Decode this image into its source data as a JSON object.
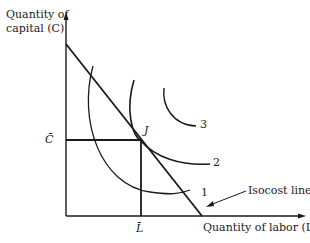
{
  "diagram": {
    "y_axis_label_line1": "Quantity of",
    "y_axis_label_line2": "capital (C)",
    "x_axis_label": "Quantity of labor (L)",
    "c_bar_label": "C̄",
    "l_bar_label": "L̄",
    "tangent_point_label": "J",
    "isoquant_labels": [
      "1",
      "2",
      "3"
    ],
    "isocost_label": "Isocost line",
    "line_color": "#1a1a1a"
  }
}
